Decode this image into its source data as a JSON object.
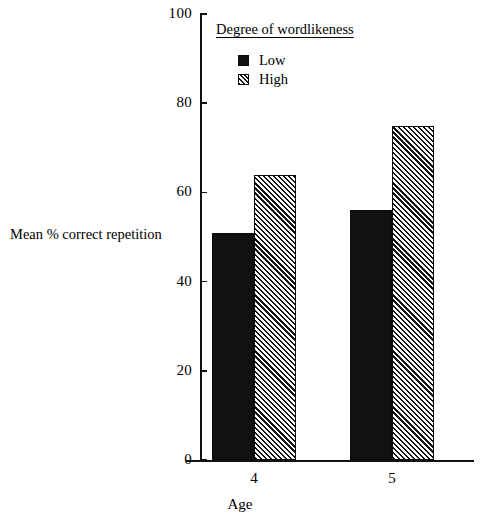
{
  "chart_data": {
    "type": "bar",
    "title": "",
    "categories": [
      "4",
      "5"
    ],
    "series": [
      {
        "name": "Low",
        "values": [
          51,
          56
        ]
      },
      {
        "name": "High",
        "values": [
          64,
          75
        ]
      }
    ],
    "xlabel": "Age",
    "ylabel": "Mean % correct repetition",
    "ylim": [
      0,
      100
    ],
    "yticks": [
      0,
      20,
      40,
      60,
      80,
      100
    ],
    "ytick_labels": [
      "0",
      "20",
      "40",
      "60",
      "80",
      "100"
    ],
    "grid": false,
    "legend": {
      "title": "Degree of wordlikeness",
      "position": "inside-top-left",
      "entries": [
        {
          "label": "Low",
          "pattern": "solid",
          "color": "#111111"
        },
        {
          "label": "High",
          "pattern": "hatch-diagonal",
          "color": "#141414"
        }
      ]
    },
    "colors": {
      "axis": "#111111",
      "text": "#000000",
      "background": "#ffffff",
      "low_fill": "#111111",
      "high_fill": "#ffffff"
    }
  }
}
